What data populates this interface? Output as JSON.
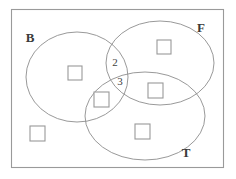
{
  "figure": {
    "kind": "venn-diagram",
    "set_count": 3,
    "universe": {
      "name": "universal-set-rectangle",
      "x": 11,
      "y": 9,
      "width": 213,
      "height": 159,
      "stroke": "#9a9a9a"
    },
    "sets": [
      {
        "key": "B",
        "label": "B",
        "label_x": 30,
        "label_y": 42,
        "cx": 77,
        "cy": 77,
        "rx": 51,
        "ry": 45,
        "stroke": "#8d8d8d"
      },
      {
        "key": "F",
        "label": "F",
        "label_x": 201,
        "label_y": 32,
        "cx": 160,
        "cy": 63,
        "rx": 54,
        "ry": 42,
        "stroke": "#8d8d8d"
      },
      {
        "key": "T",
        "label": "T",
        "label_x": 186,
        "label_y": 157,
        "cx": 145,
        "cy": 116,
        "rx": 60,
        "ry": 44,
        "stroke": "#8d8d8d"
      }
    ],
    "region_counts": [
      {
        "name": "region-count-b-f",
        "value": "2",
        "x": 115,
        "y": 66
      },
      {
        "name": "region-count-b-f-t",
        "value": "3",
        "x": 120,
        "y": 85
      }
    ],
    "elements": [
      {
        "name": "element-square-b-only",
        "region": "B only",
        "x": 68,
        "y": 66,
        "size": 14
      },
      {
        "name": "element-square-f-only",
        "region": "F only",
        "x": 157,
        "y": 40,
        "size": 14
      },
      {
        "name": "element-square-b-t",
        "region": "B and T",
        "x": 94,
        "y": 92,
        "size": 15
      },
      {
        "name": "element-square-f-t",
        "region": "F and T",
        "x": 148,
        "y": 83,
        "size": 15
      },
      {
        "name": "element-square-t-only",
        "region": "T only",
        "x": 135,
        "y": 124,
        "size": 15
      },
      {
        "name": "element-square-outside",
        "region": "outside all sets",
        "x": 30,
        "y": 126,
        "size": 15
      }
    ],
    "colors": {
      "background": "#ffffff",
      "ellipse_stroke": "#8d8d8d",
      "rect_stroke": "#9a9a9a",
      "square_stroke": "#999999",
      "text": "#3a3a3a"
    }
  }
}
